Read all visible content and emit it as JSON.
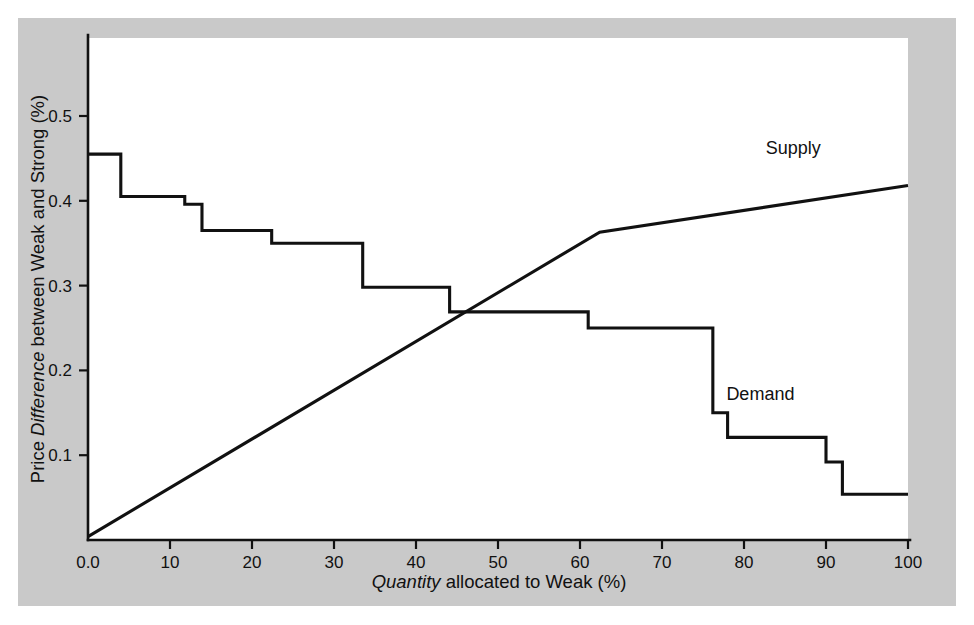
{
  "figure": {
    "background_color": "#ffffff",
    "panel_color": "#c9c9c9",
    "plot_color": "#ffffff",
    "line_color": "#111111"
  },
  "chart_data": {
    "type": "line",
    "title": "",
    "xlabel_parts": {
      "italic": "Quantity",
      "rest": " allocated to Weak (%)"
    },
    "ylabel_parts": {
      "pre": "Price ",
      "italic": "Difference",
      "rest": " between Weak and Strong (%)"
    },
    "xlabel": "Quantity allocated to Weak (%)",
    "ylabel": "Price Difference between Weak and Strong (%)",
    "xlim": [
      0,
      100
    ],
    "ylim": [
      0.0,
      0.59
    ],
    "grid": false,
    "legend_position": "inline-annotation",
    "xticks": [
      0,
      10,
      20,
      30,
      40,
      50,
      60,
      70,
      80,
      90,
      100
    ],
    "xticklabels": [
      "0.0",
      "10",
      "20",
      "30",
      "40",
      "50",
      "60",
      "70",
      "80",
      "90",
      "100"
    ],
    "yticks": [
      0.1,
      0.2,
      0.3,
      0.4,
      0.5
    ],
    "yticklabels": [
      "0.1",
      "0.2",
      "0.3",
      "0.4",
      "0.5"
    ],
    "series": [
      {
        "name": "Demand",
        "style": "step",
        "label_text": "Demand",
        "label_x": 82,
        "label_y": 0.165,
        "points": [
          [
            0.0,
            0.455
          ],
          [
            4.0,
            0.455
          ],
          [
            4.0,
            0.405
          ],
          [
            11.8,
            0.405
          ],
          [
            11.8,
            0.396
          ],
          [
            13.9,
            0.396
          ],
          [
            13.9,
            0.365
          ],
          [
            22.4,
            0.365
          ],
          [
            22.4,
            0.35
          ],
          [
            33.5,
            0.35
          ],
          [
            33.5,
            0.298
          ],
          [
            44.1,
            0.298
          ],
          [
            44.1,
            0.269
          ],
          [
            61.0,
            0.269
          ],
          [
            61.0,
            0.25
          ],
          [
            76.2,
            0.25
          ],
          [
            76.2,
            0.15
          ],
          [
            78.0,
            0.15
          ],
          [
            78.0,
            0.121
          ],
          [
            90.0,
            0.121
          ],
          [
            90.0,
            0.092
          ],
          [
            92.0,
            0.092
          ],
          [
            92.0,
            0.054
          ],
          [
            100.0,
            0.054
          ]
        ]
      },
      {
        "name": "Supply",
        "style": "line",
        "label_text": "Supply",
        "label_x": 86,
        "label_y": 0.455,
        "points": [
          [
            0.0,
            0.004
          ],
          [
            62.4,
            0.363
          ],
          [
            100.0,
            0.418
          ]
        ]
      }
    ]
  }
}
